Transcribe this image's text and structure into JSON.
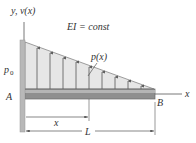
{
  "diagram": {
    "type": "cantilever beam with linearly varying distributed load",
    "labels": {
      "y_axis": "y, v(x)",
      "stiffness": "EI = const",
      "load": "p(x)",
      "load_max": "p",
      "load_max_sub": "0",
      "fixed_end": "A",
      "free_end": "B",
      "x_axis": "x",
      "position_dim": "x",
      "length_dim": "L"
    },
    "colors": {
      "wall": "#b8b8b8",
      "load_fill": "#e6e6e6",
      "beam": "#8f8f8f",
      "beam_edge": "#6a6a6a",
      "line": "#555555",
      "text": "#333333"
    },
    "load_arrow_x": [
      24,
      37,
      50,
      63,
      76,
      89,
      102,
      115,
      128,
      141
    ]
  }
}
